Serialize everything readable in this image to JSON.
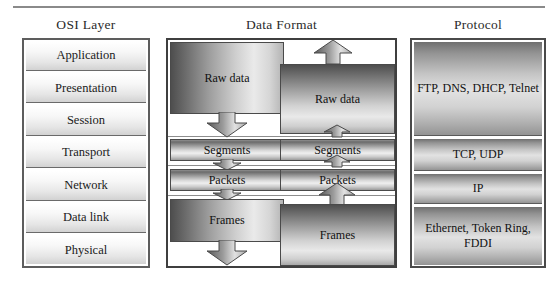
{
  "figure": {
    "columns": {
      "osi": "OSI Layer",
      "data_format": "Data Format",
      "protocol": "Protocol"
    },
    "osi_layers": [
      "Application",
      "Presentation",
      "Session",
      "Transport",
      "Network",
      "Data link",
      "Physical"
    ],
    "data_format_sending": [
      "Raw data",
      "Segments",
      "Packets",
      "Frames"
    ],
    "data_format_receiving": [
      "Raw data",
      "Segments",
      "Packets",
      "Frames"
    ],
    "protocols": [
      "FTP, DNS, DHCP, Telnet",
      "TCP, UDP",
      "IP",
      "Ethernet, Token Ring, FDDI"
    ],
    "colors": {
      "rule": "#8a8a8a",
      "frame_border": "#3f3f3f",
      "box_border": "#5d5d5d",
      "text": "#1a1a1a",
      "block_dark": "#4e4e4e",
      "block_light": "#eaeaea"
    }
  }
}
